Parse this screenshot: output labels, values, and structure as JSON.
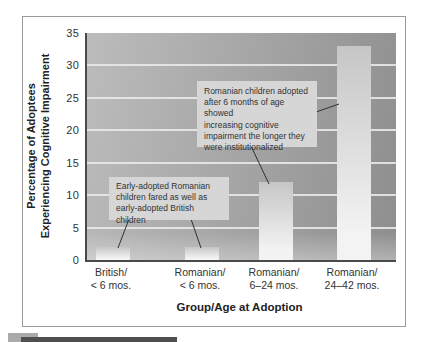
{
  "chart_data": {
    "type": "bar",
    "title": "",
    "categories": [
      "British/ < 6 mos.",
      "Romanian/ < 6 mos.",
      "Romanian/ 6–24 mos.",
      "Romanian/ 24–42 mos."
    ],
    "values": [
      2,
      2,
      12,
      33
    ],
    "xlabel": "Group/Age at Adoption",
    "ylabel": "Percentage of Adoptees Experiencing Cognitive Impairment",
    "ylim": [
      0,
      35
    ],
    "yticks": [
      0,
      5,
      10,
      15,
      20,
      25,
      30,
      35
    ],
    "grid": "horizontal light gridlines at each y tick",
    "legend": "none",
    "annotations": [
      "Romanian children adopted after 6 months of age showed increasing cognitive impairment the longer they were institutionalized",
      "Early-adopted Romanian children fared as well as early-adopted British children"
    ]
  },
  "axis": {
    "y_title_line1": "Percentage of Adoptees",
    "y_title_line2": "Experiencing Cognitive Impairment",
    "x_title": "Group/Age at Adoption",
    "y_tick_labels": [
      "35",
      "30",
      "25",
      "20",
      "15",
      "10",
      "5",
      "0"
    ]
  },
  "bars": [
    {
      "label_line1": "British/",
      "label_line2": "< 6 mos.",
      "value": 2
    },
    {
      "label_line1": "Romanian/",
      "label_line2": "< 6 mos.",
      "value": 2
    },
    {
      "label_line1": "Romanian/",
      "label_line2": "6–24 mos.",
      "value": 12
    },
    {
      "label_line1": "Romanian/",
      "label_line2": "24–42 mos.",
      "value": 33
    }
  ],
  "annotations": {
    "box1_lines": [
      "Romanian children adopted",
      "after 6 months of age showed",
      "increasing cognitive",
      "impairment the longer they",
      "were institutionalized"
    ],
    "box2_lines": [
      "Early-adopted Romanian",
      "children fared as well as",
      "early-adopted British children"
    ]
  },
  "colors": {
    "plot_bg_light": "#bcbcbc",
    "plot_bg_dark": "#8e8e8e",
    "gridline": "#e9e9e9",
    "bar_top": "#c6c6c6",
    "bar_bottom": "#f3f3f3",
    "annotation_bg": "#d6d6d6",
    "axis_line": "#4a4a4a",
    "figure_border": "#9a9a9a",
    "caption_square": "#a9aba8",
    "caption_bar": "#4f4f4f"
  }
}
